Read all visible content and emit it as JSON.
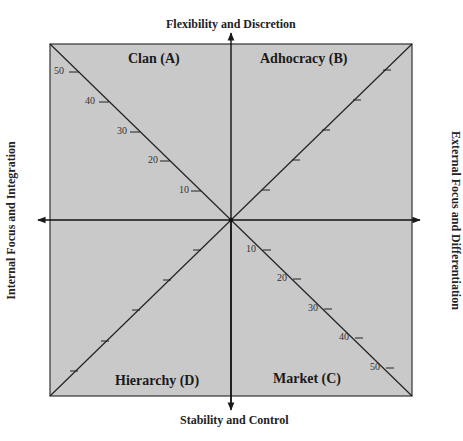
{
  "diagram": {
    "axes": {
      "top": "Flexibility and Discretion",
      "bottom": "Stability and Control",
      "left": "Internal Focus and Integration",
      "right": "External Focus and Differentiation"
    },
    "quadrants": {
      "top_left": "Clan (A)",
      "top_right": "Adhocracy (B)",
      "bottom_right": "Market (C)",
      "bottom_left": "Hierarchy (D)"
    },
    "scale_labels": {
      "a": [
        "10",
        "20",
        "30",
        "40",
        "50"
      ],
      "c": [
        "10",
        "20",
        "30",
        "40",
        "50"
      ]
    },
    "colors": {
      "fill": "#c9c9c9",
      "line": "#1a1a1a"
    }
  }
}
